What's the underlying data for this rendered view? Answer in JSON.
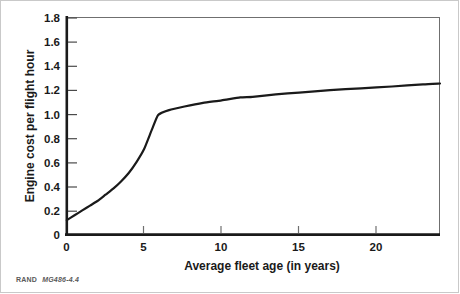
{
  "figure": {
    "credit_prefix": "RAND",
    "credit_id": "MG486-4.4",
    "background_color": "#ffffff",
    "frame_color": "#c9c9c9"
  },
  "chart_data": {
    "type": "line",
    "title": "",
    "subtitle": "",
    "xlabel": "Average fleet age (in years)",
    "ylabel": "Engine cost per flight hour",
    "xlim": [
      0,
      24.1
    ],
    "ylim": [
      0,
      1.8
    ],
    "xticks": [
      0,
      5,
      10,
      15,
      20
    ],
    "xtick_labels": [
      "0",
      "5",
      "10",
      "15",
      "20"
    ],
    "yticks": [
      0,
      0.2,
      0.4,
      0.6,
      0.8,
      1.0,
      1.2,
      1.4,
      1.6,
      1.8
    ],
    "ytick_labels": [
      "0",
      "0.2",
      "0.4",
      "0.6",
      "0.8",
      "1.0",
      "1.2",
      "1.4",
      "1.6",
      "1.8"
    ],
    "grid": false,
    "legend": null,
    "legend_position": "none",
    "line_color": "#1a1a1a",
    "line_width": 2.2,
    "annotations": [],
    "series": [
      {
        "name": "Engine cost per flight hour",
        "x": [
          0.0,
          0.5,
          1.0,
          1.5,
          2.0,
          2.5,
          3.0,
          3.5,
          4.0,
          4.5,
          5.0,
          5.5,
          5.9,
          6.6,
          7.6,
          8.8,
          10.0,
          11.2,
          12.0,
          13.5,
          15.0,
          17.0,
          19.0,
          21.0,
          23.0,
          24.1
        ],
        "y": [
          0.12,
          0.16,
          0.2,
          0.24,
          0.28,
          0.33,
          0.38,
          0.44,
          0.51,
          0.6,
          0.71,
          0.87,
          0.99,
          1.03,
          1.06,
          1.09,
          1.11,
          1.135,
          1.14,
          1.16,
          1.175,
          1.195,
          1.21,
          1.225,
          1.243,
          1.25
        ]
      }
    ]
  },
  "axes": {
    "x_axis_name": "Average fleet age (in years)",
    "y_axis_name": "Engine cost per flight hour"
  }
}
